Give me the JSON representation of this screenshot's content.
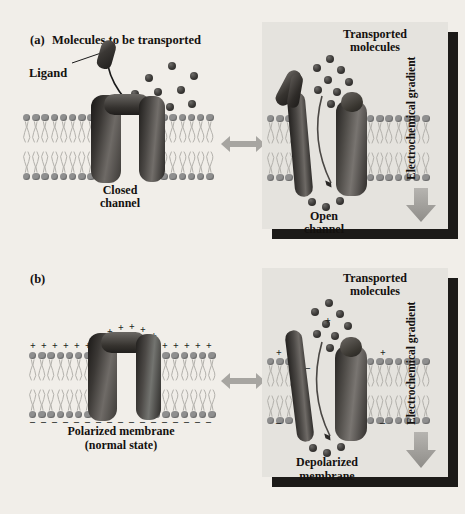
{
  "figure": {
    "background_color": "#f1eee9",
    "panel_fill": "#e5e3de",
    "shadow_color": "#1c1a18",
    "lipid_head_color": "#8f8f8f",
    "molecule_color": "#332f2c",
    "arrow_gray": "#9d9b97"
  },
  "panel_a": {
    "tag": "(a)",
    "left": {
      "title": "Molecules to be transported",
      "ligand_label": "Ligand",
      "state_label_line1": "Closed",
      "state_label_line2": "channel",
      "molecule_count": 9,
      "ligand_count": 1
    },
    "right": {
      "title_line1": "Transported",
      "title_line2": "molecules",
      "state_label_line1": "Open",
      "state_label_line2": "channel",
      "gradient_label": "Electrochemical gradient",
      "molecules_above": 9,
      "molecules_below": 3
    }
  },
  "panel_b": {
    "tag": "(b)",
    "left": {
      "state_label_line1": "Polarized membrane",
      "state_label_line2": "(normal state)",
      "outer_charge": "+",
      "inner_charge": "–",
      "outer_charge_count": 20,
      "inner_charge_count": 16
    },
    "right": {
      "title_line1": "Transported",
      "title_line2": "molecules",
      "state_label_line1": "Depolarized",
      "state_label_line2": "membrane",
      "gradient_label": "Electrochemical gradient",
      "outer_charge": "+",
      "inner_charge": "–",
      "molecules_above": 9,
      "molecules_below": 3
    }
  },
  "connectors": {
    "type": "double-headed-arrow",
    "count": 2
  }
}
